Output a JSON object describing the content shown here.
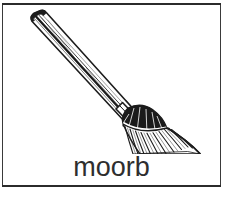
{
  "card": {
    "caption": "moorb",
    "illustration_label": "broom",
    "background_color": "#ffffff",
    "ink_color": "#1c1c1c",
    "frame_color": "#3a3a3a",
    "caption_color": "#2e2e2e"
  },
  "illustration": {
    "subject": "broom",
    "style": "black-and-white line drawing",
    "parts": {
      "handle": "wooden handle angled from upper-left to lower-right",
      "ferrule": "metal collar joining handle to brush",
      "brush": "fanned straw bristle head at lower-right"
    }
  }
}
